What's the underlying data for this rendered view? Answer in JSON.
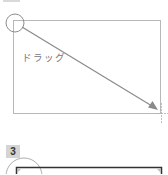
{
  "step2": {
    "badge_label": "",
    "instruction_label": "ドラッグ",
    "icons": [
      "start-point-circle-icon",
      "drag-arrow-icon",
      "crosshair-cursor-icon"
    ]
  },
  "step3": {
    "badge_label": "3",
    "icons": [
      "start-point-circle-icon"
    ]
  },
  "colors": {
    "rect_border": "#b8b8b8",
    "arrow": "#8a8a8a",
    "circle": "#8c8c8c",
    "selected_rect_border": "#333333",
    "badge_bg": "#d4d4d4"
  }
}
